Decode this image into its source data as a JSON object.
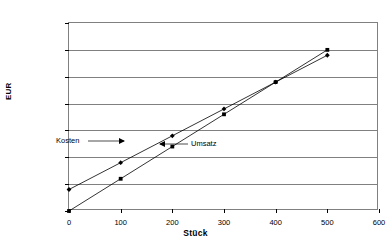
{
  "chart_data": {
    "type": "line",
    "title": "",
    "xlabel": "Stück",
    "ylabel": "EUR",
    "xlim": [
      0,
      600
    ],
    "ylim": [
      0,
      70000
    ],
    "xticks": [
      0,
      100,
      200,
      300,
      400,
      500,
      600
    ],
    "xtick_labels": [
      "0",
      "100",
      "200",
      "300",
      "400",
      "500",
      "600"
    ],
    "yticks": [
      0,
      10000,
      20000,
      30000,
      40000,
      50000,
      60000,
      70000
    ],
    "ytick_labels": [
      "0",
      "10000",
      "20000",
      "30000",
      "40000",
      "50000",
      "60000",
      "70000"
    ],
    "grid": "horizontal",
    "legend_position": "inline-annotations",
    "x": [
      0,
      100,
      200,
      300,
      400,
      500
    ],
    "series": [
      {
        "name": "Kosten",
        "marker": "diamond",
        "color": "#000000",
        "values": [
          8000,
          18000,
          28000,
          38000,
          48000,
          58000
        ]
      },
      {
        "name": "Umsatz",
        "marker": "square",
        "color": "#000000",
        "values": [
          0,
          12000,
          24000,
          36000,
          48000,
          60000
        ]
      }
    ],
    "annotations": [
      {
        "text": "Kosten",
        "points_to": "kosten-line",
        "arrow_direction": "right"
      },
      {
        "text": "Umsatz",
        "points_to": "umsatz-line",
        "arrow_direction": "left"
      }
    ]
  }
}
